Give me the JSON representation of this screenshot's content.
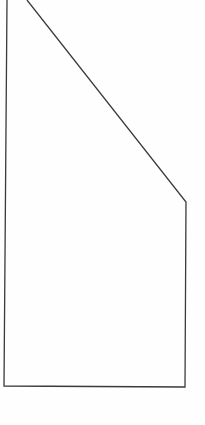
{
  "diagram": {
    "type": "line-drawing",
    "shape": "pentagon-outline",
    "stroke_color": "#3a3a3a",
    "background_color": "#fefefe",
    "stroke_width": 1.3,
    "vertices": [
      {
        "x": 7,
        "y": 0
      },
      {
        "x": 27,
        "y": 0
      },
      {
        "x": 186,
        "y": 202
      },
      {
        "x": 185,
        "y": 387
      },
      {
        "x": 4,
        "y": 386
      }
    ]
  }
}
